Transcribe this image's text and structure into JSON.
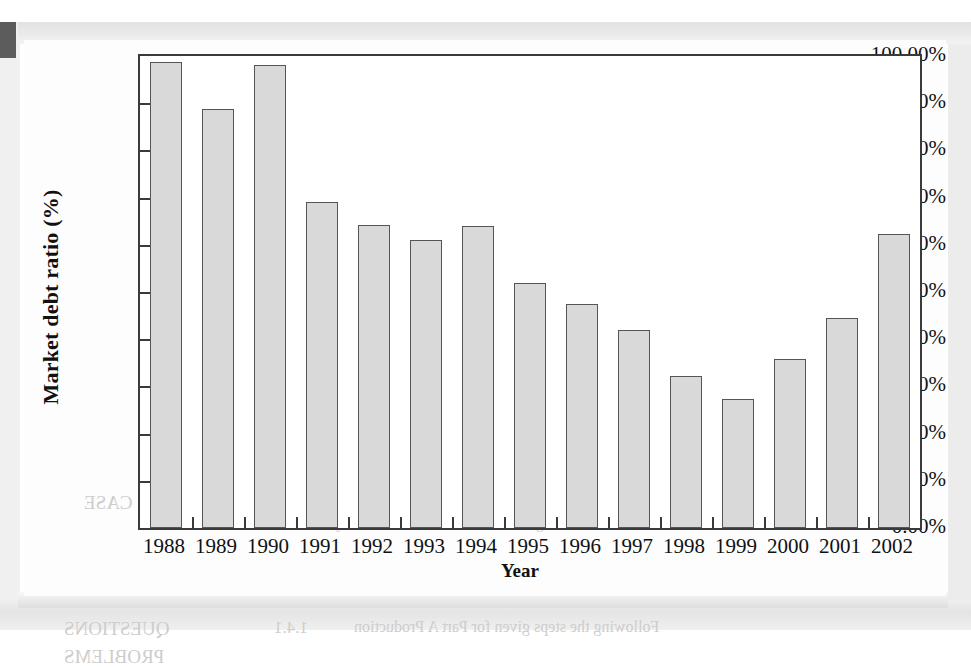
{
  "figure": {
    "background_color": "#fdfdfd",
    "frame_color": "#3a3a3a",
    "bar_fill_color": "#d9d9d9",
    "bar_border_color": "#555555"
  },
  "chart_data": {
    "type": "bar",
    "title": "",
    "xlabel": "Year",
    "ylabel": "Market debt ratio (%)",
    "categories": [
      "1988",
      "1989",
      "1990",
      "1991",
      "1992",
      "1993",
      "1994",
      "1995",
      "1996",
      "1997",
      "1998",
      "1999",
      "2000",
      "2001",
      "2002"
    ],
    "values": [
      98.8,
      88.8,
      98.0,
      69.0,
      64.2,
      61.0,
      63.9,
      52.0,
      47.5,
      42.0,
      32.3,
      27.3,
      35.8,
      44.5,
      62.2
    ],
    "value_labels": [
      "98.80%",
      "88.80%",
      "98.00%",
      "69.00%",
      "64.20%",
      "61.00%",
      "63.90%",
      "52.00%",
      "47.50%",
      "42.00%",
      "32.30%",
      "27.30%",
      "35.80%",
      "44.50%",
      "62.20%"
    ],
    "ylim": [
      0,
      100
    ],
    "ytick_values": [
      0,
      10,
      20,
      30,
      40,
      50,
      60,
      70,
      80,
      90,
      100
    ],
    "ytick_labels": [
      "0.00%",
      "10.00%",
      "20.00%",
      "30.00%",
      "40.00%",
      "50.00%",
      "60.00%",
      "70.00%",
      "80.00%",
      "90.00%",
      "100.00%"
    ],
    "grid": false,
    "legend": null,
    "legend_position": "none",
    "series": [
      {
        "name": "Market debt ratio",
        "values": [
          98.8,
          88.8,
          98.0,
          69.0,
          64.2,
          61.0,
          63.9,
          52.0,
          47.5,
          42.0,
          32.3,
          27.3,
          35.8,
          44.5,
          62.2
        ]
      }
    ]
  },
  "bleed_text": [
    {
      "text": "5. In part (b), the market's been ratio has been seen to",
      "x": 300,
      "y": 88,
      "size": 15
    },
    {
      "text": "have been measured with  this  data.",
      "x": 360,
      "y": 112,
      "size": 15
    },
    {
      "text": "KEY TERMS",
      "x": 700,
      "y": 205,
      "size": 21
    },
    {
      "text": "book value (B)",
      "x": 590,
      "y": 200,
      "size": 16
    },
    {
      "text": "market value (M)",
      "x": 580,
      "y": 228,
      "size": 16
    },
    {
      "text": "Chapter break (B)",
      "x": 560,
      "y": 252,
      "size": 16
    },
    {
      "text": "conversion ratio",
      "x": 580,
      "y": 278,
      "size": 16
    },
    {
      "text": "dividend",
      "x": 600,
      "y": 302,
      "size": 16
    },
    {
      "text": "financial leverage",
      "x": 580,
      "y": 326,
      "size": 16
    },
    {
      "text": "interest coverage",
      "x": 590,
      "y": 350,
      "size": 16
    },
    {
      "text": "residual claim",
      "x": 600,
      "y": 374,
      "size": 16
    },
    {
      "text": "CASE",
      "x": 60,
      "y": 452,
      "size": 19
    },
    {
      "text": "The firm's debt ratio is close to the industry mean, and its",
      "x": 250,
      "y": 452,
      "size": 15
    },
    {
      "text": "1.4",
      "x": 130,
      "y": 452,
      "size": 19
    },
    {
      "text": "coverage ratio remains above the industry standard.",
      "x": 250,
      "y": 476,
      "size": 15
    },
    {
      "text": "QUESTIONS",
      "x": 40,
      "y": 578,
      "size": 19
    },
    {
      "text": "1.4.1",
      "x": 250,
      "y": 578,
      "size": 17
    },
    {
      "text": "Following the steps given for Part A Production",
      "x": 330,
      "y": 578,
      "size": 16
    },
    {
      "text": "PROBLEMS",
      "x": 40,
      "y": 606,
      "size": 19
    }
  ]
}
